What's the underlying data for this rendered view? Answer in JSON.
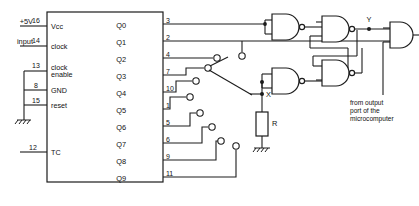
{
  "diagram": {
    "accent_color": "#1c1c1c",
    "background_color": "#ffffff"
  },
  "signals": {
    "supply": "+5V",
    "input": "input"
  },
  "chip": {
    "left_pins": [
      {
        "number": "16",
        "label": "Vcc"
      },
      {
        "number": "14",
        "label": "clock"
      },
      {
        "number": "13",
        "label": "clock enable",
        "label_line1": "clock",
        "label_line2": "enable"
      },
      {
        "number": "8",
        "label": "GND"
      },
      {
        "number": "15",
        "label": "reset"
      },
      {
        "number": "12",
        "label": "TC"
      }
    ],
    "outputs": [
      {
        "name": "Q0",
        "pin": "3"
      },
      {
        "name": "Q1",
        "pin": "2"
      },
      {
        "name": "Q2",
        "pin": "4"
      },
      {
        "name": "Q3",
        "pin": "7"
      },
      {
        "name": "Q4",
        "pin": "10"
      },
      {
        "name": "Q5",
        "pin": "1"
      },
      {
        "name": "Q6",
        "pin": "5"
      },
      {
        "name": "Q7",
        "pin": "6"
      },
      {
        "name": "Q8",
        "pin": "9"
      },
      {
        "name": "Q9",
        "pin": "11"
      }
    ]
  },
  "nodes": {
    "y": "Y",
    "x": "X",
    "resistor": "R"
  },
  "annotations": {
    "micro_note_line1": "from output",
    "micro_note_line2": "port of the",
    "micro_note_line3": "microcomputer"
  },
  "gates": {
    "inverter_top": "NAND used as inverter (Q1 path)",
    "inverter_bottom": "NAND used as inverter (X path)",
    "latch_top": "NAND latch upper",
    "latch_bottom": "NAND latch lower",
    "output_and": "AND"
  }
}
